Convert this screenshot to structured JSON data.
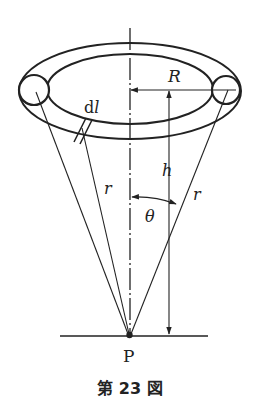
{
  "figure": {
    "caption": "第 23 図",
    "labels": {
      "radius": "R",
      "height": "h",
      "element": "dl",
      "element_d": "d",
      "element_l": "l",
      "distance_left": "r",
      "distance_right": "r",
      "angle": "θ",
      "point": "P"
    },
    "ink_color": "#222222",
    "background_color": "#ffffff"
  }
}
